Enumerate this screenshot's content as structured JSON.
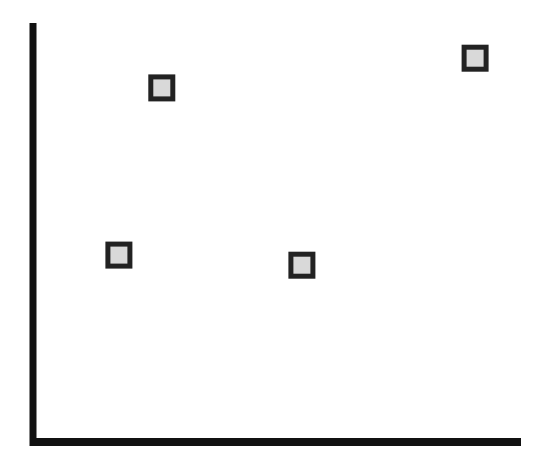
{
  "chart_data": {
    "type": "scatter",
    "title": "",
    "xlabel": "",
    "ylabel": "",
    "xlim": [
      0,
      100
    ],
    "ylim": [
      0,
      100
    ],
    "grid": false,
    "legend": null,
    "tick_labels": {
      "x": [],
      "y": []
    },
    "series": [
      {
        "name": "points",
        "marker": "square",
        "points": [
          {
            "x": 17.6,
            "y": 44.6
          },
          {
            "x": 26.4,
            "y": 84.5
          },
          {
            "x": 55.1,
            "y": 42.2
          },
          {
            "x": 90.6,
            "y": 91.6
          }
        ]
      }
    ]
  },
  "style": {
    "axis_color": "#111111",
    "marker_edge": "#222222",
    "marker_fill": "#d9d9d9",
    "background": "#ffffff"
  }
}
